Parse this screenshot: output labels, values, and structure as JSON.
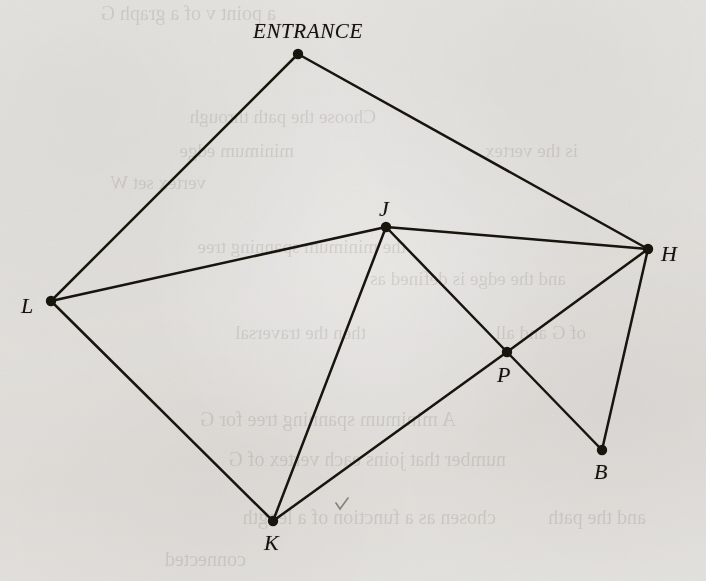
{
  "figure": {
    "kind": "undirected-graph",
    "background_color": "#f1f0ee",
    "ink_color": "#16130f",
    "width": 706,
    "height": 581
  },
  "graph": {
    "nodes": [
      {
        "id": "ENTRANCE",
        "label": "ENTRANCE",
        "x": 298,
        "y": 54,
        "label_x": 253,
        "label_y": 21,
        "label_class": "label-entrance",
        "r": 5.2
      },
      {
        "id": "J",
        "label": "J",
        "x": 386,
        "y": 227,
        "label_x": 379,
        "label_y": 198,
        "label_class": "label-vertex",
        "r": 5.2
      },
      {
        "id": "H",
        "label": "H",
        "x": 648,
        "y": 249,
        "label_x": 661,
        "label_y": 243,
        "label_class": "label-vertex",
        "r": 5.2
      },
      {
        "id": "L",
        "label": "L",
        "x": 51,
        "y": 301,
        "label_x": 21,
        "label_y": 295,
        "label_class": "label-vertex",
        "r": 5.2
      },
      {
        "id": "P",
        "label": "P",
        "x": 507,
        "y": 352,
        "label_x": 497,
        "label_y": 364,
        "label_class": "label-vertex",
        "r": 5.2
      },
      {
        "id": "B",
        "label": "B",
        "x": 602,
        "y": 450,
        "label_x": 594,
        "label_y": 461,
        "label_class": "label-vertex",
        "r": 5.2
      },
      {
        "id": "K",
        "label": "K",
        "x": 273,
        "y": 521,
        "label_x": 264,
        "label_y": 532,
        "label_class": "label-vertex",
        "r": 5.2
      }
    ],
    "edges": [
      {
        "from": "ENTRANCE",
        "to": "L",
        "name": "edge-entrance-l"
      },
      {
        "from": "ENTRANCE",
        "to": "H",
        "name": "edge-entrance-h"
      },
      {
        "from": "L",
        "to": "J",
        "name": "edge-l-j"
      },
      {
        "from": "L",
        "to": "K",
        "name": "edge-l-k"
      },
      {
        "from": "J",
        "to": "H",
        "name": "edge-j-h"
      },
      {
        "from": "J",
        "to": "P",
        "name": "edge-j-p"
      },
      {
        "from": "J",
        "to": "K",
        "name": "edge-j-k"
      },
      {
        "from": "H",
        "to": "P",
        "name": "edge-h-p"
      },
      {
        "from": "H",
        "to": "B",
        "name": "edge-h-b"
      },
      {
        "from": "P",
        "to": "B",
        "name": "edge-p-b"
      },
      {
        "from": "P",
        "to": "K",
        "name": "edge-p-k"
      }
    ],
    "edge_count": 11,
    "node_count": 7
  },
  "annotations": [
    {
      "id": "pencil-check",
      "glyph": "check-mark",
      "x": 336,
      "y": 503,
      "name": "pencil-check-mark"
    }
  ],
  "bleed_through": [
    {
      "text": "a point v of a graph G",
      "x": 430,
      "y": 2,
      "size": 20
    },
    {
      "text": "Choose the path through",
      "x": 330,
      "y": 106,
      "size": 19
    },
    {
      "text": "minimum edge",
      "x": 412,
      "y": 140,
      "size": 19
    },
    {
      "text": "is the vertex",
      "x": 128,
      "y": 140,
      "size": 19
    },
    {
      "text": "vertex set W",
      "x": 500,
      "y": 172,
      "size": 19
    },
    {
      "text": "the minimum spanning tree",
      "x": 300,
      "y": 236,
      "size": 19
    },
    {
      "text": "and the edge is defined as",
      "x": 140,
      "y": 268,
      "size": 19
    },
    {
      "text": "then the traversal",
      "x": 340,
      "y": 322,
      "size": 19
    },
    {
      "text": "of G and all",
      "x": 120,
      "y": 322,
      "size": 19
    },
    {
      "text": "A minimum spanning tree for G",
      "x": 250,
      "y": 408,
      "size": 20
    },
    {
      "text": "number that joins each vertex of G",
      "x": 200,
      "y": 448,
      "size": 20
    },
    {
      "text": "chosen as a function of a length",
      "x": 210,
      "y": 506,
      "size": 20
    },
    {
      "text": "and the path",
      "x": 60,
      "y": 506,
      "size": 20
    },
    {
      "text": "connected",
      "x": 460,
      "y": 548,
      "size": 20
    }
  ]
}
